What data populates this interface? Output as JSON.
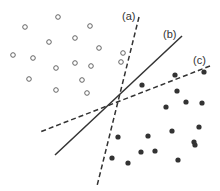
{
  "diagram": {
    "colors": {
      "line": "#333333",
      "hollow_stroke": "#555555",
      "filled": "#333333",
      "background": "#ffffff"
    },
    "labels": [
      {
        "id": "a",
        "text": "(a)",
        "x": 122,
        "y": 20
      },
      {
        "id": "b",
        "text": "(b)",
        "x": 163,
        "y": 38
      },
      {
        "id": "c",
        "text": "(c)",
        "x": 193,
        "y": 64
      }
    ],
    "lines": [
      {
        "id": "a",
        "style": "dashed",
        "x1": 139,
        "y1": 17,
        "x2": 97,
        "y2": 186
      },
      {
        "id": "b",
        "style": "solid",
        "x1": 182,
        "y1": 36,
        "x2": 55,
        "y2": 155
      },
      {
        "id": "c",
        "style": "dashed",
        "x1": 210,
        "y1": 66,
        "x2": 40,
        "y2": 132
      }
    ],
    "hollow_points": [
      [
        58,
        17
      ],
      [
        25,
        27
      ],
      [
        90,
        26
      ],
      [
        49,
        42
      ],
      [
        75,
        38
      ],
      [
        99,
        48
      ],
      [
        13,
        55
      ],
      [
        33,
        58
      ],
      [
        56,
        68
      ],
      [
        75,
        63
      ],
      [
        91,
        66
      ],
      [
        29,
        79
      ],
      [
        82,
        80
      ],
      [
        56,
        90
      ],
      [
        87,
        93
      ],
      [
        123,
        53
      ],
      [
        121,
        62
      ]
    ],
    "filled_points": [
      [
        175,
        75
      ],
      [
        204,
        72
      ],
      [
        142,
        85
      ],
      [
        177,
        91
      ],
      [
        186,
        102
      ],
      [
        166,
        107
      ],
      [
        202,
        103
      ],
      [
        148,
        136
      ],
      [
        172,
        131
      ],
      [
        199,
        127
      ],
      [
        194,
        142
      ],
      [
        155,
        151
      ],
      [
        195,
        145
      ],
      [
        112,
        158
      ],
      [
        128,
        163
      ],
      [
        141,
        152
      ],
      [
        178,
        160
      ],
      [
        118,
        137
      ]
    ]
  }
}
